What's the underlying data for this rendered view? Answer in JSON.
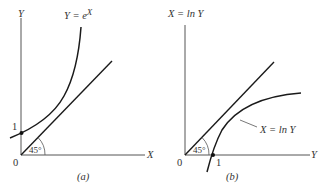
{
  "panels": [
    {
      "id": "a",
      "caption": "(a)",
      "y_axis_label": "Y",
      "x_axis_label": "X",
      "origin_label": "0",
      "curve_label_lhs": "Y = e",
      "curve_label_exp": "X",
      "tick_label": "1",
      "angle_label": "45°",
      "elements": [
        "y-axis",
        "x-axis",
        "exponential-curve",
        "45-degree-line",
        "intercept-point-at-1"
      ]
    },
    {
      "id": "b",
      "caption": "(b)",
      "y_axis_label": "X = ln Y",
      "x_axis_label": "Y",
      "origin_label": "0",
      "curve_label": "X = ln Y",
      "tick_label": "1",
      "angle_label": "45°",
      "elements": [
        "vertical-axis",
        "horizontal-axis",
        "log-curve",
        "45-degree-line",
        "intercept-point-at-1"
      ]
    }
  ],
  "colors": {
    "stroke": "#1a1a1a",
    "axis": "#555555",
    "text": "#333333",
    "background": "#ffffff"
  }
}
